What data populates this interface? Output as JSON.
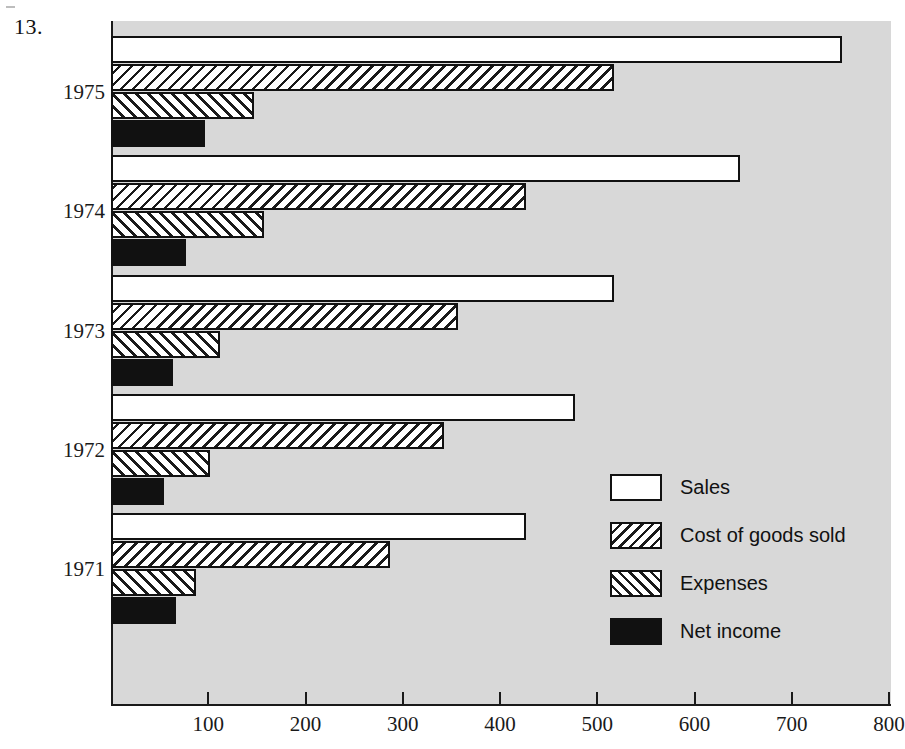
{
  "figure": {
    "number_label": "13."
  },
  "chart_data": {
    "type": "bar",
    "orientation": "horizontal",
    "title": "",
    "xlabel": "",
    "ylabel": "",
    "xlim": [
      0,
      800
    ],
    "xticks": [
      0,
      100,
      200,
      300,
      400,
      500,
      600,
      700,
      800
    ],
    "xtick_labels": [
      "",
      "100",
      "200",
      "300",
      "400",
      "500",
      "600",
      "700",
      "800"
    ],
    "grid": false,
    "legend_position": "center-right",
    "categories": [
      "1971",
      "1972",
      "1973",
      "1974",
      "1975"
    ],
    "series": [
      {
        "name": "Sales",
        "values": [
          425,
          475,
          515,
          645,
          750
        ]
      },
      {
        "name": "Cost of goods sold",
        "values": [
          285,
          340,
          355,
          425,
          515
        ]
      },
      {
        "name": "Expenses",
        "values": [
          85,
          100,
          110,
          155,
          145
        ]
      },
      {
        "name": "Net income",
        "values": [
          65,
          52,
          62,
          75,
          95
        ]
      }
    ],
    "series_styles": [
      "hollow-white",
      "forward-hatch",
      "back-hatch",
      "solid-black"
    ]
  },
  "legend": {
    "items": [
      {
        "label": "Sales",
        "swatch": "hollow-white"
      },
      {
        "label": "Cost of goods sold",
        "swatch": "forward-hatch"
      },
      {
        "label": "Expenses",
        "swatch": "back-hatch"
      },
      {
        "label": "Net income",
        "swatch": "solid-black"
      }
    ]
  },
  "colors": {
    "panel_background": "#d8d8d8",
    "page_background": "#ffffff",
    "ink": "#111111",
    "bar_fill_light": "#ffffff",
    "bar_fill_dark": "#111111"
  }
}
